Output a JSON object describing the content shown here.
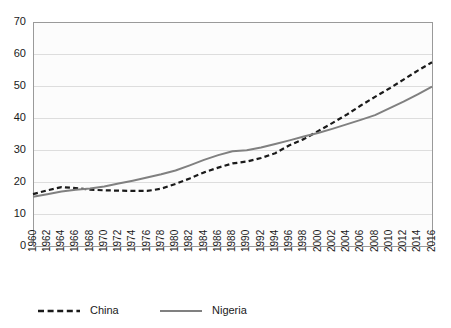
{
  "chart_data": {
    "type": "line",
    "title": "",
    "subtitle": "",
    "xlabel": "",
    "ylabel": "",
    "ylim": [
      0,
      70
    ],
    "ytick_values": [
      0,
      10,
      20,
      30,
      40,
      50,
      60,
      70
    ],
    "ytick_labels": [
      "0",
      "10",
      "20",
      "30",
      "40",
      "50",
      "60",
      "70"
    ],
    "grid": true,
    "grid_axis": "y",
    "legend_position": "bottom",
    "x": [
      1960,
      1962,
      1964,
      1966,
      1968,
      1970,
      1972,
      1974,
      1976,
      1978,
      1980,
      1982,
      1984,
      1986,
      1988,
      1990,
      1992,
      1994,
      1996,
      1998,
      2000,
      2002,
      2004,
      2006,
      2008,
      2010,
      2012,
      2014,
      2016
    ],
    "xtick_labels": [
      "1960",
      "1962",
      "1964",
      "1966",
      "1968",
      "1970",
      "1972",
      "1974",
      "1976",
      "1978",
      "1980",
      "1982",
      "1984",
      "1986",
      "1988",
      "1990",
      "1992",
      "1994",
      "1996",
      "1998",
      "2000",
      "2002",
      "2004",
      "2006",
      "2008",
      "2010",
      "2012",
      "2014",
      "2016"
    ],
    "series": [
      {
        "name": "China",
        "color": "#1a1a1a",
        "style": "dashed",
        "values": [
          16.2,
          17.4,
          18.4,
          18.1,
          17.6,
          17.4,
          17.3,
          17.2,
          17.2,
          17.9,
          19.4,
          21.1,
          23.0,
          24.5,
          25.8,
          26.4,
          27.5,
          29.0,
          31.5,
          33.4,
          35.9,
          38.4,
          41.0,
          43.9,
          46.6,
          49.2,
          52.0,
          54.8,
          57.4
        ],
        "yunits": "percent"
      },
      {
        "name": "Nigeria",
        "color": "#808080",
        "style": "solid",
        "values": [
          15.4,
          16.2,
          17.0,
          17.6,
          18.0,
          18.6,
          19.5,
          20.4,
          21.4,
          22.4,
          23.6,
          25.2,
          26.9,
          28.4,
          29.6,
          29.9,
          30.8,
          31.9,
          33.0,
          34.2,
          35.3,
          36.6,
          38.0,
          39.4,
          40.9,
          43.0,
          45.1,
          47.4,
          49.8
        ],
        "yunits": "percent"
      }
    ]
  },
  "legend": {
    "items": [
      {
        "label": "China",
        "color": "#1a1a1a",
        "style": "dashed"
      },
      {
        "label": "Nigeria",
        "color": "#808080",
        "style": "solid"
      }
    ]
  }
}
